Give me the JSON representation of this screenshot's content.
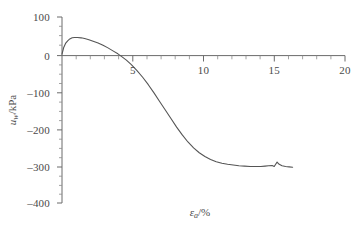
{
  "chart_data": {
    "type": "line",
    "title": "",
    "subtitle": "",
    "xlabel": "εa/%",
    "xlabel_symbol": "ε",
    "xlabel_subscript": "a",
    "xlabel_unit": "/%",
    "ylabel": "uw/kPa",
    "ylabel_symbol": "u",
    "ylabel_subscript": "w",
    "ylabel_unit": "/kPa",
    "xlim": [
      0,
      20
    ],
    "ylim": [
      -400,
      100
    ],
    "xticks": [
      0,
      5,
      10,
      15,
      20
    ],
    "xtick_labels": [
      "",
      "5",
      "10",
      "15",
      "20"
    ],
    "x_minor_tick_interval": 1,
    "yticks": [
      100,
      0,
      -100,
      -200,
      -300,
      -400
    ],
    "ytick_labels": [
      "100",
      "0",
      "–100",
      "–200",
      "–300",
      "–400"
    ],
    "y_minor_tick_interval": 25,
    "grid": false,
    "legend": null,
    "zero_line": true,
    "line_color": "#555555",
    "axis_color": "#6b6b6b",
    "background_color": "#ffffff",
    "series": [
      {
        "name": "pore water pressure",
        "x": [
          0.0,
          0.12,
          0.25,
          0.4,
          0.55,
          0.72,
          0.9,
          1.1,
          1.35,
          1.6,
          1.9,
          2.2,
          2.55,
          2.9,
          3.25,
          3.6,
          3.95,
          4.2,
          4.55,
          4.9,
          5.3,
          5.7,
          6.1,
          6.5,
          6.9,
          7.3,
          7.7,
          8.1,
          8.5,
          8.9,
          9.3,
          9.7,
          10.1,
          10.5,
          10.9,
          11.3,
          11.7,
          12.1,
          12.5,
          12.9,
          13.3,
          13.7,
          14.05,
          14.35,
          14.6,
          14.85,
          15.0,
          15.1,
          15.2,
          15.35,
          15.55,
          15.8,
          16.05,
          16.3
        ],
        "y": [
          0,
          18,
          29,
          36,
          41,
          44,
          45,
          45,
          44,
          42,
          39,
          35,
          30,
          24,
          17,
          9,
          1,
          -6,
          -16,
          -28,
          -44,
          -62,
          -82,
          -104,
          -127,
          -150,
          -173,
          -196,
          -217,
          -236,
          -252,
          -265,
          -275,
          -283,
          -289,
          -293,
          -296,
          -298,
          -300,
          -301,
          -302,
          -302,
          -302,
          -301,
          -300,
          -299,
          -302,
          -296,
          -290,
          -296,
          -300,
          -302,
          -303,
          -304
        ],
        "peak_value": 45,
        "peak_x": 1.0,
        "zero_crossing_x": 4.0,
        "plateau_value": -300,
        "end_x": 16.3,
        "end_value": -304
      }
    ]
  },
  "axis": {
    "y_title_display": "u",
    "y_title_sub": "w",
    "y_title_unit": "/kPa",
    "x_title_display": "ε",
    "x_title_sub": "a",
    "x_title_unit": "/%"
  }
}
